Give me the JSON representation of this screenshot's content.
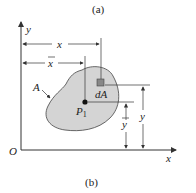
{
  "captions": {
    "top": "(a)",
    "bottom": "(b)"
  },
  "labels": {
    "y_axis": "y",
    "x_axis": "x",
    "origin": "O",
    "area": "A",
    "element": "dA",
    "centroid_base": "P",
    "centroid_sub": "1",
    "dim_x": "x",
    "dim_xbar": "x",
    "dim_ybar": "y",
    "dim_y": "y"
  },
  "colors": {
    "shape_fill": "#d4d4d4",
    "element_fill": "#888888",
    "line": "#333333"
  }
}
